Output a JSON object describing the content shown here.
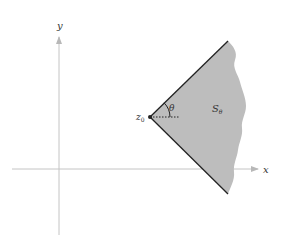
{
  "diagram": {
    "axes": {
      "x_label": "x",
      "y_label": "y",
      "axis_color": "#b8b8b8"
    },
    "vertex": {
      "label_main": "z",
      "label_sub": "0"
    },
    "angle": {
      "label": "θ"
    },
    "region": {
      "label_main": "S",
      "label_sub": "θ",
      "fill_color": "#bdbdbd",
      "edge_color": "#222222"
    }
  }
}
